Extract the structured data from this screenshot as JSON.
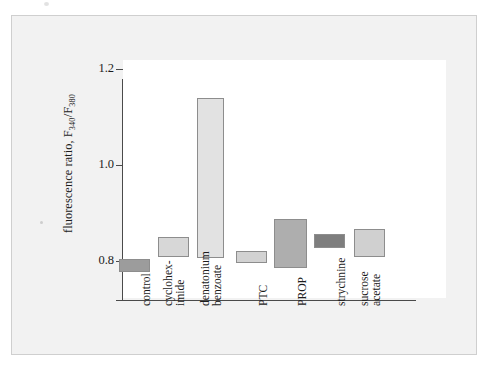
{
  "figure": {
    "background_color": "#ffffff",
    "panel_color": "#f2f2f2",
    "panel_border_color": "#cfcfcf",
    "plot_background_color": "#ffffff",
    "axis_color": "#4a4a4a"
  },
  "axis": {
    "y_title_main": "fluorescence ratio, F",
    "y_title_sub1": "340",
    "y_title_slash": "/F",
    "y_title_sub2": "380",
    "y_ticks": [
      {
        "label": "1.2",
        "value": 1.2
      },
      {
        "label": "1.0",
        "value": 1.0
      },
      {
        "label": "0.8",
        "value": 0.8
      }
    ]
  },
  "categories": [
    {
      "line1": "control",
      "line2": ""
    },
    {
      "line1": "cyclohex-",
      "line2": "imide"
    },
    {
      "line1": "denatonium",
      "line2": "benzoate"
    },
    {
      "line1": "PTC",
      "line2": ""
    },
    {
      "line1": "PROP",
      "line2": ""
    },
    {
      "line1": "strychnine",
      "line2": ""
    },
    {
      "line1": "sucrose",
      "line2": "acetate"
    }
  ],
  "chart_data": {
    "type": "bar",
    "title": "",
    "subtitle": "",
    "xlabel": "",
    "ylabel": "fluorescence ratio, F340/F380",
    "ylim": [
      0.76,
      1.24
    ],
    "grid": false,
    "legend": "none",
    "note": "Floating (range) bars: each bar spans from a low to a high fluorescence ratio value.",
    "categories": [
      "control",
      "cyclohex-imide",
      "denatonium benzoate",
      "PTC",
      "PROP",
      "strychnine",
      "sucrose acetate"
    ],
    "series": [
      {
        "name": "range low",
        "values": [
          0.777,
          0.808,
          0.806,
          0.796,
          0.785,
          0.827,
          0.808
        ]
      },
      {
        "name": "range high",
        "values": [
          0.804,
          0.85,
          1.14,
          0.821,
          0.887,
          0.856,
          0.867
        ]
      }
    ],
    "bars": [
      {
        "category": "control",
        "low": 0.777,
        "high": 0.804,
        "color": "#9c9c9c"
      },
      {
        "category": "cyclohex-imide",
        "low": 0.808,
        "high": 0.85,
        "color": "#d7d7d7"
      },
      {
        "category": "denatonium benzoate",
        "low": 0.806,
        "high": 1.14,
        "color": "#e2e2e2"
      },
      {
        "category": "PTC",
        "low": 0.796,
        "high": 0.821,
        "color": "#d2d2d2"
      },
      {
        "category": "PROP",
        "low": 0.785,
        "high": 0.887,
        "color": "#aeaeae"
      },
      {
        "category": "strychnine",
        "low": 0.827,
        "high": 0.856,
        "color": "#7e7e7e"
      },
      {
        "category": "sucrose acetate",
        "low": 0.808,
        "high": 0.867,
        "color": "#d0d0d0"
      }
    ]
  }
}
